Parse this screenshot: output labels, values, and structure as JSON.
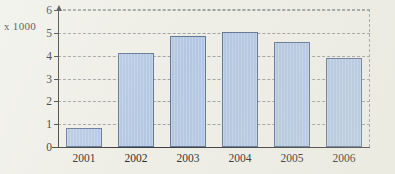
{
  "chart_data": {
    "type": "bar",
    "title": "",
    "subtitle": "",
    "xlabel": "",
    "ylabel": "x 1000",
    "categories": [
      "2001",
      "2002",
      "2003",
      "2004",
      "2005",
      "2006"
    ],
    "values": [
      0.85,
      4.1,
      4.85,
      5.05,
      4.6,
      3.9
    ],
    "ylim": [
      0,
      6
    ],
    "yticks": [
      0,
      1,
      2,
      3,
      4,
      5,
      6
    ],
    "ytick_labels": [
      "0",
      "1",
      "2",
      "3",
      "4",
      "5",
      "6"
    ],
    "grid": true,
    "grid_style": "dashed-horizontal",
    "legend": null,
    "legend_position": "none",
    "series": [
      {
        "name": "",
        "values": [
          0.85,
          4.1,
          4.85,
          5.05,
          4.6,
          3.9
        ]
      }
    ],
    "annotations": []
  },
  "axis": {
    "y_caption": "x 1000",
    "y_tick_labels": [
      "6",
      "5",
      "4",
      "3",
      "2",
      "1",
      "0"
    ],
    "x_tick_labels": [
      "2001",
      "2002",
      "2003",
      "2004",
      "2005",
      "2006"
    ]
  },
  "colors": {
    "background": "#eeeee6",
    "bar_fill": "#b3c7e2",
    "bar_border": "#5f7695",
    "grid": "#9ba39f",
    "axis": "#3a3a3a",
    "text": "#2d2d2d"
  }
}
